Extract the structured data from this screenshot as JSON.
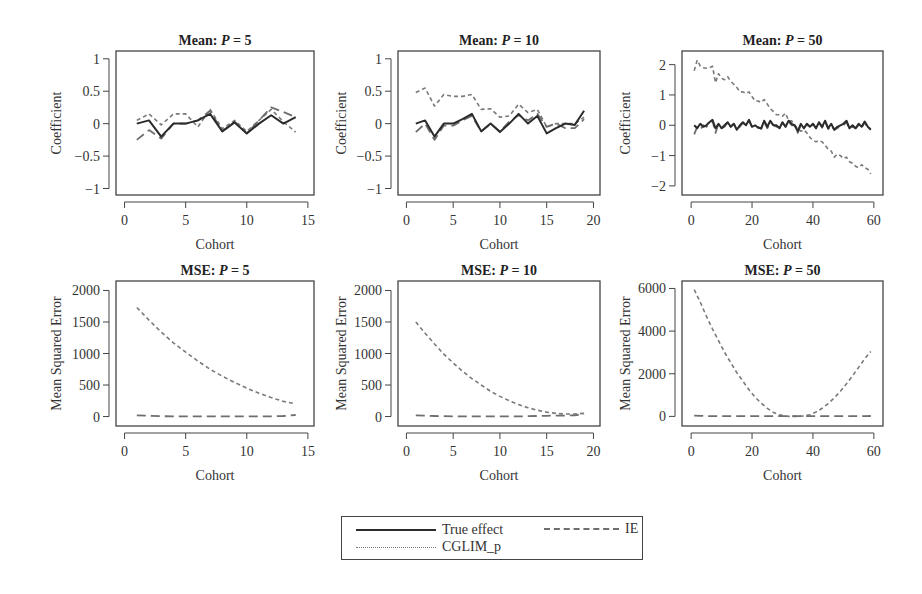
{
  "chart_data": [
    {
      "id": "mean_p5",
      "type": "line",
      "title_prefix": "Mean: ",
      "title_var": "P",
      "title_suffix": " = 5",
      "xlabel": "Cohort",
      "ylabel": "Coefficient",
      "xlim": [
        -0.7,
        15.5
      ],
      "ylim": [
        -1.1,
        1.12
      ],
      "xticks": [
        0,
        5,
        10,
        15
      ],
      "yticks": [
        1,
        0.5,
        0,
        -0.5,
        -1
      ],
      "ytick_labels": [
        "1",
        "0.5",
        "0",
        "−0.5",
        "−1"
      ],
      "grid": false,
      "x": [
        1,
        2,
        3,
        4,
        5,
        6,
        7,
        8,
        9,
        10,
        11,
        12,
        13,
        14
      ],
      "series": [
        {
          "name": "True effect",
          "values": [
            0.0,
            0.05,
            -0.2,
            0.0,
            0.0,
            0.05,
            0.15,
            -0.12,
            0.02,
            -0.15,
            0.0,
            0.13,
            0.0,
            0.1
          ]
        },
        {
          "name": "IE",
          "values": [
            -0.25,
            -0.1,
            -0.23,
            0.0,
            0.0,
            0.05,
            0.2,
            -0.12,
            0.03,
            -0.15,
            0.05,
            0.25,
            0.18,
            0.1
          ]
        },
        {
          "name": "CGLIM_p",
          "values": [
            0.05,
            0.15,
            -0.02,
            0.15,
            0.15,
            -0.05,
            0.22,
            -0.08,
            0.05,
            -0.12,
            0.05,
            0.22,
            0.03,
            -0.13
          ]
        }
      ]
    },
    {
      "id": "mean_p10",
      "type": "line",
      "title_prefix": "Mean: ",
      "title_var": "P",
      "title_suffix": " = 10",
      "xlabel": "Cohort",
      "ylabel": "Coefficient",
      "xlim": [
        -0.9,
        20.7
      ],
      "ylim": [
        -1.1,
        1.12
      ],
      "xticks": [
        0,
        5,
        10,
        15,
        20
      ],
      "yticks": [
        1,
        0.5,
        0,
        -0.5,
        -1
      ],
      "ytick_labels": [
        "1",
        "0.5",
        "0",
        "−0.5",
        "−1"
      ],
      "grid": false,
      "x": [
        1,
        2,
        3,
        4,
        5,
        6,
        7,
        8,
        9,
        10,
        11,
        12,
        13,
        14,
        15,
        16,
        17,
        18,
        19
      ],
      "series": [
        {
          "name": "True effect",
          "values": [
            0.0,
            0.05,
            -0.2,
            0.0,
            0.0,
            0.07,
            0.15,
            -0.12,
            0.0,
            -0.13,
            0.0,
            0.15,
            0.0,
            0.12,
            -0.15,
            -0.07,
            0.0,
            -0.02,
            0.2
          ]
        },
        {
          "name": "IE",
          "values": [
            -0.13,
            0.0,
            -0.25,
            -0.03,
            -0.03,
            0.05,
            0.12,
            -0.12,
            0.0,
            -0.12,
            0.03,
            0.13,
            0.05,
            0.15,
            -0.05,
            0.0,
            -0.07,
            -0.07,
            0.07
          ]
        },
        {
          "name": "CGLIM_p",
          "values": [
            0.48,
            0.55,
            0.27,
            0.45,
            0.42,
            0.42,
            0.45,
            0.22,
            0.23,
            0.1,
            0.12,
            0.3,
            0.17,
            0.22,
            -0.05,
            0.0,
            0.0,
            0.0,
            0.1
          ]
        }
      ]
    },
    {
      "id": "mean_p50",
      "type": "line",
      "title_prefix": "Mean: ",
      "title_var": "P",
      "title_suffix": " = 50",
      "xlabel": "Cohort",
      "ylabel": "Coefficient",
      "xlim": [
        -3,
        63
      ],
      "ylim": [
        -2.3,
        2.45
      ],
      "xticks": [
        0,
        20,
        40,
        60
      ],
      "yticks": [
        2,
        1,
        0,
        -1,
        -2
      ],
      "ytick_labels": [
        "2",
        "1",
        "0",
        "−1",
        "−2"
      ],
      "grid": false,
      "x": [
        1,
        2,
        3,
        4,
        5,
        6,
        7,
        8,
        9,
        10,
        11,
        12,
        13,
        14,
        15,
        16,
        17,
        18,
        19,
        20,
        21,
        22,
        23,
        24,
        25,
        26,
        27,
        28,
        29,
        30,
        31,
        32,
        33,
        34,
        35,
        36,
        37,
        38,
        39,
        40,
        41,
        42,
        43,
        44,
        45,
        46,
        47,
        48,
        49,
        50,
        51,
        52,
        53,
        54,
        55,
        56,
        57,
        58,
        59
      ],
      "series": [
        {
          "name": "True effect",
          "values": [
            0.0,
            -0.1,
            0.05,
            -0.05,
            0.0,
            0.1,
            0.18,
            -0.1,
            0.05,
            -0.1,
            0.0,
            0.1,
            -0.05,
            0.05,
            -0.15,
            0.0,
            0.1,
            0.0,
            0.18,
            -0.05,
            0.0,
            -0.08,
            -0.1,
            0.15,
            -0.05,
            0.15,
            0.0,
            0.0,
            -0.1,
            0.1,
            -0.05,
            0.15,
            0.05,
            0.0,
            -0.2,
            0.05,
            -0.1,
            0.05,
            -0.05,
            0.05,
            -0.1,
            0.1,
            -0.05,
            0.15,
            -0.1,
            0.05,
            -0.15,
            -0.05,
            0.0,
            0.05,
            0.15,
            -0.1,
            0.0,
            -0.1,
            0.05,
            -0.05,
            0.12,
            -0.05,
            -0.15
          ]
        },
        {
          "name": "IE",
          "values": [
            -0.3,
            -0.05,
            -0.15,
            0.0,
            -0.05,
            0.05,
            0.15,
            -0.25,
            0.05,
            -0.1,
            -0.05,
            0.1,
            -0.05,
            0.05,
            -0.12,
            -0.05,
            0.08,
            0.0,
            0.15,
            -0.05,
            -0.05,
            -0.05,
            -0.12,
            0.12,
            -0.1,
            0.12,
            0.0,
            -0.05,
            -0.05,
            0.08,
            -0.05,
            0.12,
            0.0,
            0.0,
            -0.25,
            0.0,
            -0.12,
            0.05,
            -0.1,
            0.05,
            -0.1,
            0.08,
            -0.08,
            0.12,
            -0.12,
            0.0,
            -0.15,
            -0.1,
            0.0,
            0.0,
            0.1,
            -0.12,
            -0.05,
            -0.1,
            0.0,
            -0.08,
            0.1,
            -0.1,
            -0.12
          ]
        },
        {
          "name": "CGLIM_p",
          "values": [
            1.8,
            2.15,
            1.95,
            1.9,
            1.88,
            1.9,
            1.95,
            1.4,
            1.7,
            1.55,
            1.5,
            1.6,
            1.45,
            1.35,
            1.25,
            1.1,
            1.1,
            1.05,
            1.1,
            0.95,
            0.8,
            0.8,
            0.75,
            0.85,
            0.7,
            0.55,
            0.45,
            0.35,
            0.35,
            0.3,
            0.4,
            0.15,
            0.15,
            0.0,
            -0.1,
            -0.2,
            -0.15,
            -0.25,
            -0.4,
            -0.5,
            -0.55,
            -0.5,
            -0.55,
            -0.65,
            -0.8,
            -0.85,
            -1.05,
            -0.95,
            -1.0,
            -1.1,
            -1.05,
            -1.2,
            -1.25,
            -1.35,
            -1.4,
            -1.3,
            -1.4,
            -1.45,
            -1.6
          ]
        }
      ]
    },
    {
      "id": "mse_p5",
      "type": "line",
      "title_prefix": "MSE: ",
      "title_var": "P",
      "title_suffix": " = 5",
      "xlabel": "Cohort",
      "ylabel": "Mean Squared Error",
      "xlim": [
        -0.7,
        15.5
      ],
      "ylim": [
        -150,
        2150
      ],
      "xticks": [
        0,
        5,
        10,
        15
      ],
      "yticks": [
        2000,
        1500,
        1000,
        500,
        0
      ],
      "ytick_labels": [
        "2000",
        "1500",
        "1000",
        "500",
        "0"
      ],
      "grid": false,
      "x": [
        1,
        2,
        3,
        4,
        5,
        6,
        7,
        8,
        9,
        10,
        11,
        12,
        13,
        14
      ],
      "series": [
        {
          "name": "True effect",
          "values": [
            0,
            0,
            0,
            0,
            0,
            0,
            0,
            0,
            0,
            0,
            0,
            0,
            0,
            0
          ]
        },
        {
          "name": "IE",
          "values": [
            20,
            12,
            5,
            3,
            2,
            2,
            2,
            2,
            2,
            2,
            2,
            3,
            8,
            25
          ]
        },
        {
          "name": "CGLIM_p",
          "values": [
            1730,
            1530,
            1340,
            1170,
            1020,
            880,
            750,
            640,
            540,
            450,
            370,
            300,
            240,
            200
          ]
        }
      ]
    },
    {
      "id": "mse_p10",
      "type": "line",
      "title_prefix": "MSE: ",
      "title_var": "P",
      "title_suffix": " = 10",
      "xlabel": "Cohort",
      "ylabel": "Mean Squared Error",
      "xlim": [
        -0.9,
        20.7
      ],
      "ylim": [
        -150,
        2150
      ],
      "xticks": [
        0,
        5,
        10,
        15,
        20
      ],
      "yticks": [
        2000,
        1500,
        1000,
        500,
        0
      ],
      "ytick_labels": [
        "2000",
        "1500",
        "1000",
        "500",
        "0"
      ],
      "grid": false,
      "x": [
        1,
        2,
        3,
        4,
        5,
        6,
        7,
        8,
        9,
        10,
        11,
        12,
        13,
        14,
        15,
        16,
        17,
        18,
        19
      ],
      "series": [
        {
          "name": "True effect",
          "values": [
            0,
            0,
            0,
            0,
            0,
            0,
            0,
            0,
            0,
            0,
            0,
            0,
            0,
            0,
            0,
            0,
            0,
            0,
            0
          ]
        },
        {
          "name": "IE",
          "values": [
            20,
            15,
            8,
            5,
            3,
            3,
            2,
            2,
            2,
            2,
            2,
            3,
            5,
            8,
            12,
            15,
            15,
            20,
            40
          ]
        },
        {
          "name": "CGLIM_p",
          "values": [
            1500,
            1320,
            1150,
            990,
            850,
            720,
            600,
            500,
            400,
            320,
            250,
            190,
            140,
            100,
            70,
            50,
            40,
            40,
            50
          ]
        }
      ]
    },
    {
      "id": "mse_p50",
      "type": "line",
      "title_prefix": "MSE: ",
      "title_var": "P",
      "title_suffix": " = 50",
      "xlabel": "Cohort",
      "ylabel": "Mean Squared Error",
      "xlim": [
        -3,
        63
      ],
      "ylim": [
        -450,
        6350
      ],
      "xticks": [
        0,
        20,
        40,
        60
      ],
      "yticks": [
        6000,
        4000,
        2000,
        0
      ],
      "ytick_labels": [
        "6000",
        "4000",
        "2000",
        "0"
      ],
      "grid": false,
      "x": [
        1,
        3,
        5,
        7,
        9,
        11,
        13,
        15,
        17,
        19,
        21,
        23,
        25,
        27,
        29,
        31,
        33,
        35,
        37,
        39,
        41,
        43,
        45,
        47,
        49,
        51,
        53,
        55,
        57,
        59
      ],
      "series": [
        {
          "name": "True effect",
          "values": [
            0,
            0,
            0,
            0,
            0,
            0,
            0,
            0,
            0,
            0,
            0,
            0,
            0,
            0,
            0,
            0,
            0,
            0,
            0,
            0,
            0,
            0,
            0,
            0,
            0,
            0,
            0,
            0,
            0,
            0
          ]
        },
        {
          "name": "IE",
          "values": [
            40,
            30,
            20,
            15,
            10,
            10,
            10,
            10,
            10,
            10,
            10,
            10,
            10,
            10,
            10,
            10,
            10,
            10,
            10,
            10,
            10,
            10,
            10,
            10,
            10,
            10,
            10,
            10,
            10,
            20
          ]
        },
        {
          "name": "CGLIM_p",
          "values": [
            5950,
            5350,
            4700,
            4100,
            3550,
            3000,
            2520,
            2050,
            1650,
            1250,
            900,
            620,
            380,
            190,
            70,
            10,
            0,
            0,
            20,
            80,
            200,
            380,
            600,
            870,
            1180,
            1530,
            1900,
            2300,
            2700,
            3050
          ]
        }
      ]
    }
  ],
  "series_styles": {
    "True effect": {
      "color": "#2b2b2b",
      "width": 2.0,
      "dash": ""
    },
    "IE": {
      "color": "#6e6e6e",
      "width": 1.8,
      "dash": "9,5"
    },
    "CGLIM_p": {
      "color": "#7a7a7a",
      "width": 1.6,
      "dash": "4,3"
    }
  },
  "legend": {
    "items": [
      {
        "label": "True effect",
        "style": "solid"
      },
      {
        "label": "IE",
        "style": "long-dash"
      },
      {
        "label": "CGLIM_p",
        "style": "short-dash"
      }
    ]
  },
  "colors": {
    "axis": "#444444",
    "text": "#333333",
    "background": "#ffffff"
  }
}
